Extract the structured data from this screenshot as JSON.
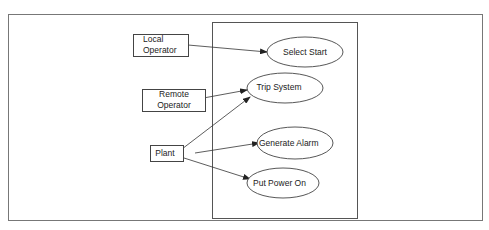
{
  "diagram": {
    "type": "use-case",
    "colors": {
      "stroke": "#444444",
      "text": "#222222",
      "background": "#ffffff",
      "outer_frame": "#777777"
    },
    "actors": [
      {
        "id": "local-operator",
        "lines": [
          "Local",
          "Operator"
        ]
      },
      {
        "id": "remote-operator",
        "lines": [
          "Remote",
          "Operator"
        ]
      },
      {
        "id": "plant",
        "lines": [
          "Plant"
        ]
      }
    ],
    "use_cases": [
      {
        "id": "select-start",
        "label": "Select Start"
      },
      {
        "id": "trip-system",
        "label": "Trip System"
      },
      {
        "id": "generate-alarm",
        "label": "Generate Alarm"
      },
      {
        "id": "put-power-on",
        "label": "Put Power On"
      }
    ],
    "associations": [
      {
        "from": "local-operator",
        "to": "select-start"
      },
      {
        "from": "remote-operator",
        "to": "trip-system"
      },
      {
        "from": "plant",
        "to": "trip-system"
      },
      {
        "from": "plant",
        "to": "generate-alarm"
      },
      {
        "from": "plant",
        "to": "put-power-on"
      }
    ]
  }
}
